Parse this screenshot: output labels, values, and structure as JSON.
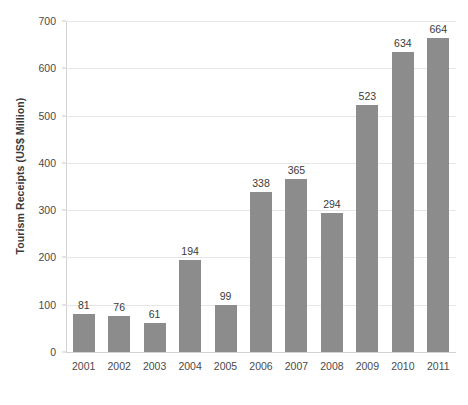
{
  "chart_data": {
    "type": "bar",
    "title": "",
    "subtitle": "",
    "xlabel": "",
    "ylabel": "Tourism Receipts (US$ Million)",
    "categories": [
      "2001",
      "2002",
      "2003",
      "2004",
      "2005",
      "2006",
      "2007",
      "2008",
      "2009",
      "2010",
      "2011"
    ],
    "values": [
      81,
      76,
      61,
      194,
      99,
      338,
      365,
      294,
      523,
      634,
      664
    ],
    "data_labels": [
      "81",
      "76",
      "61",
      "194",
      "99",
      "338",
      "365",
      "294",
      "523",
      "634",
      "664"
    ],
    "ylim": [
      0,
      700
    ],
    "y_ticks": [
      0,
      100,
      200,
      300,
      400,
      500,
      600,
      700
    ],
    "y_tick_labels": [
      "0",
      "100",
      "200",
      "300",
      "400",
      "500",
      "600",
      "700"
    ],
    "grid": "horizontal",
    "legend": "none",
    "bar_color": "#8c8c8c",
    "gridline_color": "#e6e6e6",
    "axis_color": "#d2d2d2",
    "background_color": "#ffffff",
    "text_color": "#3a3a3a"
  }
}
